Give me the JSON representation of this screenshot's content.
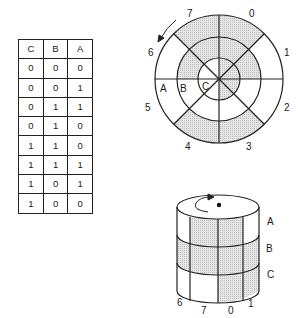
{
  "truth_table": {
    "headers": [
      "C",
      "B",
      "A"
    ],
    "rows": [
      [
        "0",
        "0",
        "0"
      ],
      [
        "0",
        "0",
        "1"
      ],
      [
        "0",
        "1",
        "1"
      ],
      [
        "0",
        "1",
        "0"
      ],
      [
        "1",
        "1",
        "0"
      ],
      [
        "1",
        "1",
        "1"
      ],
      [
        "1",
        "0",
        "1"
      ],
      [
        "1",
        "0",
        "0"
      ]
    ]
  },
  "disk": {
    "sector_labels": [
      "0",
      "1",
      "2",
      "3",
      "4",
      "5",
      "6",
      "7"
    ],
    "ring_labels": [
      "A",
      "B",
      "C"
    ],
    "shading_rule": "shaded = 0",
    "rotation_arrow": "counterclockwise"
  },
  "cylinder": {
    "band_labels": [
      "A",
      "B",
      "C"
    ],
    "visible_sector_labels": [
      "6",
      "7",
      "0",
      "1"
    ],
    "rotation_arrow": "clockwise"
  },
  "colors": {
    "line": "#222222",
    "shade": "#d9d9d9",
    "background": "#ffffff"
  }
}
